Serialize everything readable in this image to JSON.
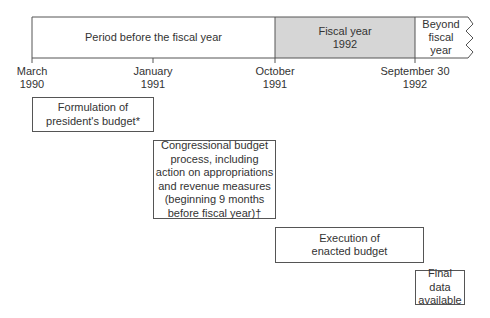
{
  "timeline": {
    "segments": [
      {
        "id": "before",
        "label": "Period before the fiscal year",
        "fill": "#ffffff"
      },
      {
        "id": "fiscal",
        "label": "Fiscal year\n1992",
        "fill": "#d6d6d6"
      },
      {
        "id": "beyond",
        "label": "Beyond\nfiscal\nyear",
        "fill": "#ffffff"
      }
    ],
    "ticks": [
      {
        "label": "March\n1990"
      },
      {
        "label": "January\n1991"
      },
      {
        "label": "October\n1991"
      },
      {
        "label": "September 30\n1992"
      }
    ]
  },
  "boxes": [
    {
      "id": "formulation",
      "label": "Formulation of\npresident's budget*"
    },
    {
      "id": "congressional",
      "label": "Congressional budget\nprocess, including\naction on appropriations\nand revenue measures\n(beginning 9 months\nbefore fiscal year)†"
    },
    {
      "id": "execution",
      "label": "Execution of\nenacted budget"
    },
    {
      "id": "final",
      "label": "Final data\navailable"
    }
  ],
  "colors": {
    "line": "#555555",
    "shaded": "#d6d6d6",
    "text": "#333333"
  }
}
